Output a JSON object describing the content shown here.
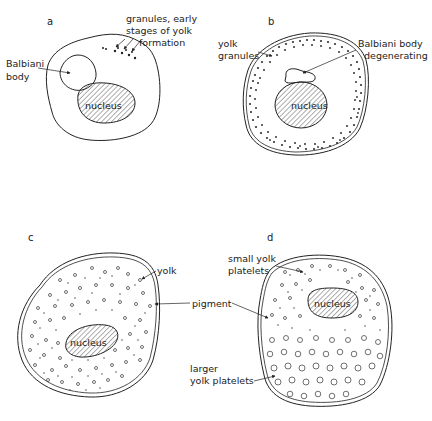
{
  "figure": {
    "panels": [
      {
        "id": "a",
        "label": "a",
        "nucleus_label": "nucleus",
        "annotations": [
          {
            "text_lines": [
              "granules, early",
              "stages of yolk",
              "formation"
            ]
          },
          {
            "text_lines": [
              "Balbiani",
              "body"
            ]
          }
        ]
      },
      {
        "id": "b",
        "label": "b",
        "nucleus_label": "nucleus",
        "annotations": [
          {
            "text_lines": [
              "yolk",
              "granules"
            ]
          },
          {
            "text_lines": [
              "Balbiani body",
              "degenerating"
            ]
          }
        ]
      },
      {
        "id": "c",
        "label": "c",
        "nucleus_label": "nucleus",
        "annotations": [
          {
            "text_lines": [
              "yolk"
            ]
          }
        ]
      },
      {
        "id": "d",
        "label": "d",
        "nucleus_label": "nucleus",
        "annotations": [
          {
            "text_lines": [
              "small yolk",
              "platelets"
            ]
          },
          {
            "text_lines": [
              "larger",
              "yolk platelets"
            ]
          }
        ]
      }
    ],
    "shared_annotations": [
      {
        "text": "pigment",
        "points_to": [
          "c",
          "d"
        ]
      }
    ],
    "colors": {
      "ink": "#222222",
      "background": "#ffffff"
    }
  }
}
